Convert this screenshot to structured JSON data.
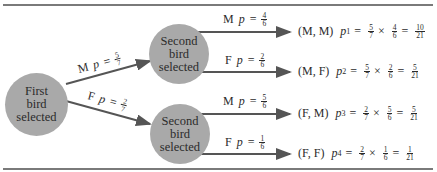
{
  "colors": {
    "node_fill": "#a9a9a9",
    "line": "#555555",
    "rule": "#7a7a7a"
  },
  "nodes": {
    "first": {
      "lines": [
        "First",
        "bird",
        "selected"
      ]
    },
    "second_upper": {
      "lines": [
        "Second",
        "bird",
        "selected"
      ]
    },
    "second_lower": {
      "lines": [
        "Second",
        "bird",
        "selected"
      ]
    }
  },
  "branches": {
    "first_m": {
      "sex": "M",
      "p": "p",
      "eq": "=",
      "num": "5",
      "den": "7"
    },
    "first_f": {
      "sex": "F",
      "p": "p",
      "eq": "=",
      "num": "2",
      "den": "7"
    },
    "upper_m": {
      "sex": "M",
      "p": "p",
      "eq": "=",
      "num": "4",
      "den": "6"
    },
    "upper_f": {
      "sex": "F",
      "p": "p",
      "eq": "=",
      "num": "2",
      "den": "6"
    },
    "lower_m": {
      "sex": "M",
      "p": "p",
      "eq": "=",
      "num": "5",
      "den": "6"
    },
    "lower_f": {
      "sex": "F",
      "p": "p",
      "eq": "=",
      "num": "1",
      "den": "6"
    }
  },
  "outcomes": [
    {
      "pair": "(M, M)",
      "p": "p",
      "sub": "1",
      "eq": "=",
      "a_num": "5",
      "a_den": "7",
      "times": "×",
      "b_num": "4",
      "b_den": "6",
      "eq2": "=",
      "r_num": "10",
      "r_den": "21"
    },
    {
      "pair": "(M, F)",
      "p": "p",
      "sub": "2",
      "eq": "=",
      "a_num": "5",
      "a_den": "7",
      "times": "×",
      "b_num": "2",
      "b_den": "6",
      "eq2": "=",
      "r_num": "5",
      "r_den": "21"
    },
    {
      "pair": "(F, M)",
      "p": "p",
      "sub": "3",
      "eq": "=",
      "a_num": "2",
      "a_den": "7",
      "times": "×",
      "b_num": "5",
      "b_den": "6",
      "eq2": "=",
      "r_num": "5",
      "r_den": "21"
    },
    {
      "pair": "(F, F)",
      "p": "p",
      "sub": "4",
      "eq": "=",
      "a_num": "2",
      "a_den": "7",
      "times": "×",
      "b_num": "1",
      "b_den": "6",
      "eq2": "=",
      "r_num": "1",
      "r_den": "21"
    }
  ]
}
